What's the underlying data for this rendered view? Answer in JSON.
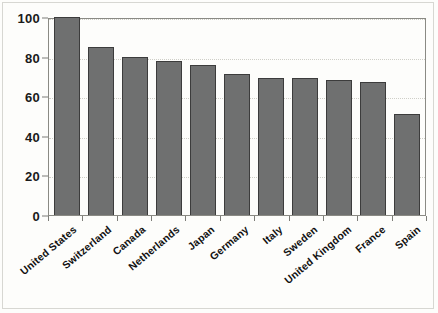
{
  "chart_data": {
    "type": "bar",
    "title": "",
    "subtitle": "",
    "xlabel": "",
    "ylabel": "",
    "categories": [
      "United States",
      "Switzerland",
      "Canada",
      "Netherlands",
      "Japan",
      "Germany",
      "Italy",
      "Sweden",
      "United Kingdom",
      "France",
      "Spain"
    ],
    "values": [
      100,
      85,
      80,
      78,
      76,
      71,
      69,
      69,
      68,
      67,
      51
    ],
    "series": [
      {
        "name": "",
        "values": [
          100,
          85,
          80,
          78,
          76,
          71,
          69,
          69,
          68,
          67,
          51
        ]
      }
    ],
    "ylim": [
      0,
      100
    ],
    "yticks": [
      0,
      20,
      40,
      60,
      80,
      100
    ],
    "ytick_labels": [
      "0",
      "20",
      "40",
      "60",
      "80",
      "100"
    ],
    "grid": true,
    "grid_axis": "y",
    "legend": false,
    "legend_position": "none",
    "bar_color": "#6f7070",
    "bar_edge_color": "#3c3c3c",
    "plot_background": "#fdfdfb",
    "axis_color": "#8a8a84",
    "gridline_color": "#cfcfc8",
    "label_rotation_degrees": -40,
    "annotations": []
  }
}
